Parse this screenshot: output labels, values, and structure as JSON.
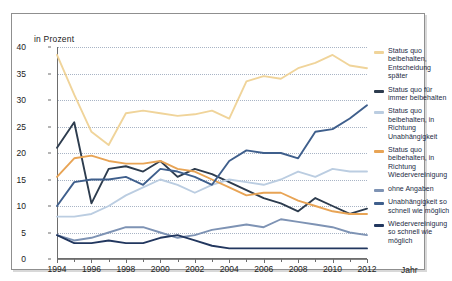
{
  "chart_data": {
    "type": "line",
    "title": "",
    "xlabel": "Jahr",
    "ylabel": "in Prozent",
    "ylim": [
      0,
      40
    ],
    "ytick_step": 5,
    "yticks": [
      "0",
      "5",
      "10",
      "15",
      "20",
      "25",
      "30",
      "35",
      "40"
    ],
    "xlim": [
      1994,
      2012
    ],
    "x": [
      1994,
      1995,
      1996,
      1997,
      1998,
      1999,
      2000,
      2001,
      2002,
      2003,
      2004,
      2005,
      2006,
      2007,
      2008,
      2009,
      2010,
      2011,
      2012
    ],
    "xticks": [
      "1994",
      "1996",
      "1998",
      "2000",
      "2002",
      "2004",
      "2006",
      "2008",
      "2010",
      "2012"
    ],
    "xtick_values": [
      1994,
      1996,
      1998,
      2000,
      2002,
      2004,
      2006,
      2008,
      2010,
      2012
    ],
    "grid": "horizontal-dotted",
    "legend_position": "right",
    "series": [
      {
        "name": "Status quo beibehalten, Entscheidung später",
        "color": "#f0d49a",
        "values": [
          38.5,
          31.0,
          24.0,
          21.5,
          27.5,
          28.0,
          27.5,
          27.0,
          27.3,
          28.0,
          26.5,
          33.5,
          34.5,
          34.0,
          36.0,
          37.0,
          38.5,
          36.5,
          36.0
        ]
      },
      {
        "name": "Status quo für immer beibehalten",
        "color": "#2d3c4e",
        "values": [
          21.0,
          25.8,
          10.5,
          17.0,
          17.5,
          16.5,
          18.5,
          15.5,
          17.0,
          16.0,
          14.5,
          13.0,
          11.5,
          10.5,
          9.0,
          11.5,
          10.0,
          8.5,
          9.5
        ]
      },
      {
        "name": "Status quo beibehalten, in Richtung Unabhängigkeit",
        "color": "#bbcde1",
        "values": [
          8.0,
          8.0,
          8.5,
          10.0,
          12.0,
          13.5,
          15.0,
          14.0,
          12.5,
          14.0,
          15.0,
          14.5,
          14.0,
          15.0,
          16.5,
          15.5,
          17.0,
          16.5,
          16.5
        ]
      },
      {
        "name": "Status quo beibehalten, in Richtung Wiedervereinigung",
        "color": "#e8a455",
        "values": [
          15.5,
          19.0,
          19.5,
          18.5,
          18.0,
          18.0,
          18.5,
          17.0,
          16.5,
          15.0,
          13.5,
          12.0,
          12.5,
          12.5,
          11.0,
          10.0,
          9.0,
          8.5,
          8.5
        ]
      },
      {
        "name": "ohne Angaben",
        "color": "#7e93b4",
        "values": [
          4.5,
          3.5,
          4.0,
          5.0,
          6.0,
          6.0,
          5.0,
          4.0,
          4.5,
          5.5,
          6.0,
          6.5,
          6.0,
          7.5,
          7.0,
          6.5,
          6.0,
          5.0,
          4.5
        ]
      },
      {
        "name": "Unabhängigkeit so schnell wie möglich",
        "color": "#3f5f8c",
        "values": [
          10.0,
          14.5,
          15.0,
          15.0,
          15.5,
          14.0,
          17.0,
          16.5,
          15.5,
          14.0,
          18.5,
          20.5,
          20.0,
          20.0,
          19.0,
          24.0,
          24.5,
          26.5,
          29.0
        ]
      },
      {
        "name": "Wiedervereinigung so schnell wie möglich",
        "color": "#22375f",
        "values": [
          4.5,
          3.0,
          3.0,
          3.5,
          3.0,
          3.0,
          4.0,
          4.5,
          3.5,
          2.5,
          2.0,
          2.0,
          2.0,
          2.0,
          2.0,
          2.0,
          2.0,
          2.0,
          2.0
        ]
      }
    ]
  },
  "legend": {
    "items": [
      {
        "label": "Status quo beibehalten, Entscheidung später",
        "color": "#f0d49a"
      },
      {
        "label": "Status quo für immer beibehalten",
        "color": "#2d3c4e"
      },
      {
        "label": "Status quo beibehalten, in Richtung Unabhängigkeit",
        "color": "#bbcde1"
      },
      {
        "label": "Status quo beibehalten, in Richtung Wiedervereinigung",
        "color": "#e8a455"
      },
      {
        "label": "ohne Angaben",
        "color": "#7e93b4"
      },
      {
        "label": "Unabhängigkeit so schnell wie möglich",
        "color": "#3f5f8c"
      },
      {
        "label": "Wiedervereinigung so schnell wie möglich",
        "color": "#22375f"
      }
    ]
  }
}
